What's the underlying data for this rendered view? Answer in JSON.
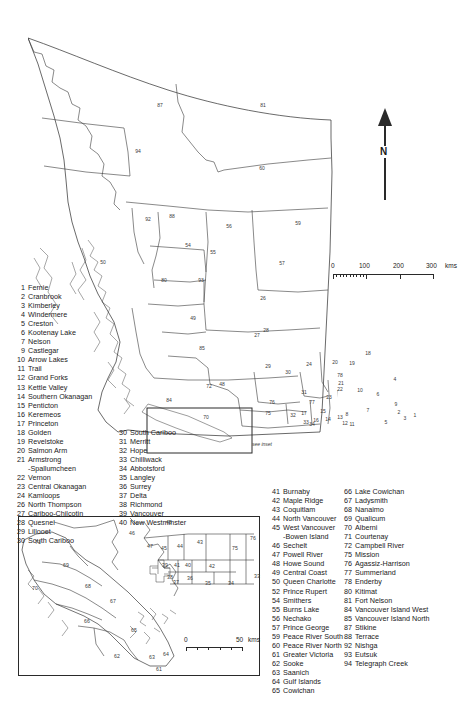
{
  "map": {
    "title": "British Columbia Regional Districts",
    "north_arrow_label": "N",
    "see_inset_label": "see inset",
    "scalebar": {
      "unit": "kms",
      "labels": [
        "0",
        "100",
        "200",
        "300"
      ]
    },
    "inset_scalebar": {
      "unit": "kms",
      "labels": [
        "0",
        "50"
      ]
    }
  },
  "legend": {
    "column1": [
      {
        "num": "1",
        "name": "Fernie"
      },
      {
        "num": "2",
        "name": "Cranbrook"
      },
      {
        "num": "3",
        "name": "Kimberley"
      },
      {
        "num": "4",
        "name": "Windermere"
      },
      {
        "num": "5",
        "name": "Creston"
      },
      {
        "num": "6",
        "name": "Kootenay Lake"
      },
      {
        "num": "7",
        "name": "Nelson"
      },
      {
        "num": "9",
        "name": "Castlegar"
      },
      {
        "num": "10",
        "name": "Arrow Lakes"
      },
      {
        "num": "11",
        "name": "Trail"
      },
      {
        "num": "12",
        "name": "Grand Forks"
      },
      {
        "num": "13",
        "name": "Kettle Valley"
      },
      {
        "num": "14",
        "name": "Southern Okanagan"
      },
      {
        "num": "15",
        "name": "Penticton"
      },
      {
        "num": "16",
        "name": "Keremeos"
      },
      {
        "num": "17",
        "name": "Princeton"
      },
      {
        "num": "18",
        "name": "Golden"
      },
      {
        "num": "19",
        "name": "Revelstoke"
      },
      {
        "num": "20",
        "name": "Salmon Arm"
      },
      {
        "num": "21",
        "name": "Armstrong"
      },
      {
        "num": "",
        "name": "-Spallumcheen",
        "cont": true
      },
      {
        "num": "22",
        "name": "Vernon"
      },
      {
        "num": "23",
        "name": "Central Okanagan"
      },
      {
        "num": "24",
        "name": "Kamloops"
      },
      {
        "num": "26",
        "name": "North Thompson"
      },
      {
        "num": "27",
        "name": "Cariboo-Chilcotin"
      },
      {
        "num": "28",
        "name": "Quesnel"
      },
      {
        "num": "29",
        "name": "Lillooet"
      },
      {
        "num": "30",
        "name": "South Cariboo"
      }
    ],
    "column2": [
      {
        "num": "30",
        "name": "South Cariboo"
      },
      {
        "num": "31",
        "name": "Merritt"
      },
      {
        "num": "32",
        "name": "Hope"
      },
      {
        "num": "33",
        "name": "Chilliwack"
      },
      {
        "num": "34",
        "name": "Abbotsford"
      },
      {
        "num": "35",
        "name": "Langley"
      },
      {
        "num": "36",
        "name": "Surrey"
      },
      {
        "num": "37",
        "name": "Delta"
      },
      {
        "num": "38",
        "name": "Richmond"
      },
      {
        "num": "39",
        "name": "Vancouver"
      },
      {
        "num": "40",
        "name": "New Westminster"
      }
    ],
    "column3": [
      {
        "num": "41",
        "name": "Burnaby"
      },
      {
        "num": "42",
        "name": "Maple Ridge"
      },
      {
        "num": "43",
        "name": "Coquitlam"
      },
      {
        "num": "44",
        "name": "North Vancouver"
      },
      {
        "num": "45",
        "name": "West Vancouver"
      },
      {
        "num": "",
        "name": "-Bowen Island",
        "cont": true
      },
      {
        "num": "46",
        "name": "Sechelt"
      },
      {
        "num": "47",
        "name": "Powell River"
      },
      {
        "num": "48",
        "name": "Howe Sound"
      },
      {
        "num": "49",
        "name": "Central Coast"
      },
      {
        "num": "50",
        "name": "Queen Charlotte"
      },
      {
        "num": "52",
        "name": "Prince Rupert"
      },
      {
        "num": "54",
        "name": "Smithers"
      },
      {
        "num": "55",
        "name": "Burns Lake"
      },
      {
        "num": "56",
        "name": "Nechako"
      },
      {
        "num": "57",
        "name": "Prince George"
      },
      {
        "num": "59",
        "name": "Peace River South"
      },
      {
        "num": "60",
        "name": "Peace River North"
      },
      {
        "num": "61",
        "name": "Greater Victoria"
      },
      {
        "num": "62",
        "name": "Sooke"
      },
      {
        "num": "63",
        "name": "Saanich"
      },
      {
        "num": "64",
        "name": "Gulf Islands"
      },
      {
        "num": "65",
        "name": "Cowichan"
      }
    ],
    "column4": [
      {
        "num": "66",
        "name": "Lake Cowichan"
      },
      {
        "num": "67",
        "name": "Ladysmith"
      },
      {
        "num": "68",
        "name": "Nanaimo"
      },
      {
        "num": "69",
        "name": "Qualicum"
      },
      {
        "num": "70",
        "name": "Alberni"
      },
      {
        "num": "71",
        "name": "Courtenay"
      },
      {
        "num": "72",
        "name": "Campbell River"
      },
      {
        "num": "75",
        "name": "Mission"
      },
      {
        "num": "76",
        "name": "Agassiz-Harrison"
      },
      {
        "num": "77",
        "name": "Summerland"
      },
      {
        "num": "78",
        "name": "Enderby"
      },
      {
        "num": "80",
        "name": "Kitimat"
      },
      {
        "num": "81",
        "name": "Fort Nelson"
      },
      {
        "num": "84",
        "name": "Vancouver Island West"
      },
      {
        "num": "85",
        "name": "Vancouver Island North"
      },
      {
        "num": "87",
        "name": "Stikine"
      },
      {
        "num": "88",
        "name": "Terrace"
      },
      {
        "num": "92",
        "name": "Nishga"
      },
      {
        "num": "93",
        "name": "Eutsuk"
      },
      {
        "num": "94",
        "name": "Telegraph Creek"
      }
    ]
  },
  "main_map_numbers": [
    {
      "n": "87",
      "x": 160,
      "y": 105
    },
    {
      "n": "81",
      "x": 263,
      "y": 105
    },
    {
      "n": "94",
      "x": 138,
      "y": 151
    },
    {
      "n": "60",
      "x": 262,
      "y": 168
    },
    {
      "n": "92",
      "x": 148,
      "y": 219
    },
    {
      "n": "88",
      "x": 172,
      "y": 216
    },
    {
      "n": "56",
      "x": 229,
      "y": 226
    },
    {
      "n": "59",
      "x": 298,
      "y": 223
    },
    {
      "n": "54",
      "x": 188,
      "y": 245
    },
    {
      "n": "55",
      "x": 213,
      "y": 252
    },
    {
      "n": "57",
      "x": 282,
      "y": 263
    },
    {
      "n": "80",
      "x": 164,
      "y": 280
    },
    {
      "n": "93",
      "x": 201,
      "y": 280
    },
    {
      "n": "26",
      "x": 263,
      "y": 298
    },
    {
      "n": "50",
      "x": 103,
      "y": 262
    },
    {
      "n": "49",
      "x": 193,
      "y": 318
    },
    {
      "n": "27",
      "x": 257,
      "y": 335
    },
    {
      "n": "85",
      "x": 202,
      "y": 348
    },
    {
      "n": "28",
      "x": 266,
      "y": 330
    },
    {
      "n": "29",
      "x": 268,
      "y": 366
    },
    {
      "n": "30",
      "x": 288,
      "y": 372
    },
    {
      "n": "24",
      "x": 309,
      "y": 364
    },
    {
      "n": "20",
      "x": 335,
      "y": 362
    },
    {
      "n": "18",
      "x": 368,
      "y": 353
    },
    {
      "n": "19",
      "x": 352,
      "y": 363
    },
    {
      "n": "78",
      "x": 340,
      "y": 375
    },
    {
      "n": "21",
      "x": 341,
      "y": 383
    },
    {
      "n": "22",
      "x": 340,
      "y": 389
    },
    {
      "n": "23",
      "x": 329,
      "y": 397
    },
    {
      "n": "31",
      "x": 304,
      "y": 392
    },
    {
      "n": "77",
      "x": 312,
      "y": 402
    },
    {
      "n": "48",
      "x": 222,
      "y": 384
    },
    {
      "n": "84",
      "x": 169,
      "y": 400
    },
    {
      "n": "72",
      "x": 209,
      "y": 386
    },
    {
      "n": "70",
      "x": 206,
      "y": 417
    },
    {
      "n": "76",
      "x": 272,
      "y": 402
    },
    {
      "n": "75",
      "x": 268,
      "y": 413
    },
    {
      "n": "32",
      "x": 293,
      "y": 415
    },
    {
      "n": "17",
      "x": 304,
      "y": 413
    },
    {
      "n": "10",
      "x": 360,
      "y": 390
    },
    {
      "n": "6",
      "x": 378,
      "y": 394
    },
    {
      "n": "4",
      "x": 395,
      "y": 379
    },
    {
      "n": "9",
      "x": 396,
      "y": 404
    },
    {
      "n": "7",
      "x": 368,
      "y": 410
    },
    {
      "n": "2",
      "x": 399,
      "y": 412
    },
    {
      "n": "8",
      "x": 347,
      "y": 414
    },
    {
      "n": "15",
      "x": 323,
      "y": 411
    },
    {
      "n": "14",
      "x": 328,
      "y": 419
    },
    {
      "n": "16",
      "x": 316,
      "y": 420
    },
    {
      "n": "13",
      "x": 340,
      "y": 417
    },
    {
      "n": "12",
      "x": 345,
      "y": 423
    },
    {
      "n": "11",
      "x": 352,
      "y": 424
    },
    {
      "n": "3",
      "x": 405,
      "y": 418
    },
    {
      "n": "5",
      "x": 386,
      "y": 422
    },
    {
      "n": "1",
      "x": 415,
      "y": 415
    },
    {
      "n": "33",
      "x": 306,
      "y": 422
    },
    {
      "n": "34",
      "x": 312,
      "y": 424
    }
  ],
  "inset_map_numbers": [
    {
      "n": "71",
      "x": 38,
      "y": 542
    },
    {
      "n": "69",
      "x": 66,
      "y": 565
    },
    {
      "n": "70",
      "x": 35,
      "y": 588
    },
    {
      "n": "68",
      "x": 88,
      "y": 586
    },
    {
      "n": "67",
      "x": 113,
      "y": 601
    },
    {
      "n": "66",
      "x": 87,
      "y": 621
    },
    {
      "n": "65",
      "x": 134,
      "y": 630
    },
    {
      "n": "62",
      "x": 117,
      "y": 656
    },
    {
      "n": "61",
      "x": 159,
      "y": 669
    },
    {
      "n": "63",
      "x": 152,
      "y": 657
    },
    {
      "n": "64",
      "x": 166,
      "y": 654
    },
    {
      "n": "46",
      "x": 132,
      "y": 533
    },
    {
      "n": "48",
      "x": 169,
      "y": 522
    },
    {
      "n": "47",
      "x": 150,
      "y": 546
    },
    {
      "n": "45",
      "x": 164,
      "y": 548
    },
    {
      "n": "44",
      "x": 180,
      "y": 546
    },
    {
      "n": "43",
      "x": 200,
      "y": 542
    },
    {
      "n": "42",
      "x": 212,
      "y": 566
    },
    {
      "n": "75",
      "x": 235,
      "y": 548
    },
    {
      "n": "76",
      "x": 253,
      "y": 538
    },
    {
      "n": "33",
      "x": 257,
      "y": 576
    },
    {
      "n": "34",
      "x": 231,
      "y": 583
    },
    {
      "n": "35",
      "x": 208,
      "y": 583
    },
    {
      "n": "36",
      "x": 190,
      "y": 578
    },
    {
      "n": "37",
      "x": 176,
      "y": 582
    },
    {
      "n": "38",
      "x": 170,
      "y": 577
    },
    {
      "n": "39",
      "x": 165,
      "y": 565
    },
    {
      "n": "40",
      "x": 188,
      "y": 565
    },
    {
      "n": "41",
      "x": 177,
      "y": 565
    }
  ]
}
